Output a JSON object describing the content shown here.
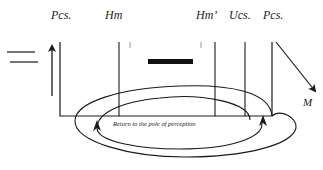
{
  "labels": {
    "pcs_left": "Pcs.",
    "hm": "Hm",
    "hm_prime": "Hm’",
    "ucs": "Ucs.",
    "pcs_right": "Pcs.",
    "motor": "M",
    "caption": "Return  to the pole of perception"
  },
  "colors": {
    "ink": "#1a1a1a",
    "background": "#ffffff"
  }
}
